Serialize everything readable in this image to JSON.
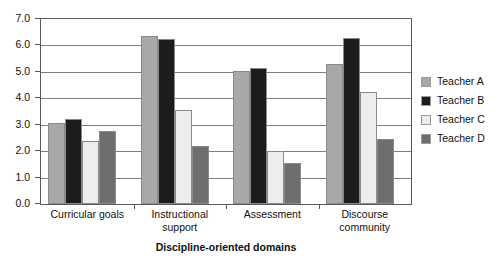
{
  "chart_data": {
    "type": "bar",
    "title": "",
    "subtitle": "",
    "xlabel": "Discipline-oriented domains",
    "ylabel": "",
    "ylim": [
      0.0,
      7.0
    ],
    "ytick_step": 1.0,
    "yticks": [
      "0.0",
      "1.0",
      "2.0",
      "3.0",
      "4.0",
      "5.0",
      "6.0",
      "7.0"
    ],
    "grid": true,
    "grid_axis": "y",
    "legend_position": "right",
    "categories": [
      "Curricular goals",
      "Instructional support",
      "Assessment",
      "Discourse community"
    ],
    "category_lines": [
      [
        "Curricular goals"
      ],
      [
        "Instructional",
        "support"
      ],
      [
        "Assessment"
      ],
      [
        "Discourse",
        "community"
      ]
    ],
    "series": [
      {
        "name": "Teacher A",
        "color": "#a8a8a8",
        "values": [
          3.05,
          6.35,
          5.05,
          5.3
        ]
      },
      {
        "name": "Teacher B",
        "color": "#1c1c1c",
        "values": [
          3.2,
          6.25,
          5.15,
          6.3
        ]
      },
      {
        "name": "Teacher C",
        "color": "#ededed",
        "values": [
          2.4,
          3.55,
          2.0,
          4.25
        ]
      },
      {
        "name": "Teacher D",
        "color": "#6e6e6e",
        "values": [
          2.75,
          2.2,
          1.55,
          2.45
        ]
      }
    ]
  },
  "legend": {
    "entries": [
      {
        "label": "Teacher A",
        "color": "#a8a8a8"
      },
      {
        "label": "Teacher B",
        "color": "#1c1c1c"
      },
      {
        "label": "Teacher C",
        "color": "#ededed"
      },
      {
        "label": "Teacher D",
        "color": "#6e6e6e"
      }
    ]
  },
  "colors": {
    "axis": "#5a5a5a",
    "grid": "#7d7d7d",
    "background": "#ffffff",
    "text": "#111111"
  }
}
